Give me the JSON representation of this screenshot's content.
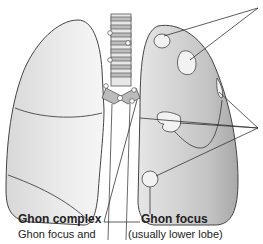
{
  "diagram": {
    "labels": {
      "ghon_complex_title": "Ghon complex",
      "ghon_complex_desc": "Ghon focus and",
      "ghon_focus_title": "Ghon focus",
      "ghon_focus_desc": "(usually lower lobe)"
    },
    "colors": {
      "lung_light": "#eeeeee",
      "lung_dark": "#b8b8b8",
      "outline": "#444444",
      "lesion": "#f2f2f2"
    }
  }
}
